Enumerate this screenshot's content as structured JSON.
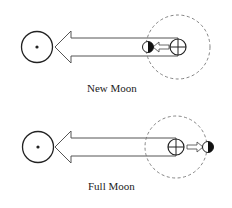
{
  "panels": [
    {
      "id": "new-moon",
      "caption": "New Moon",
      "moon_side": "left"
    },
    {
      "id": "full-moon",
      "caption": "Full Moon",
      "moon_side": "right"
    }
  ],
  "colors": {
    "stroke": "#222222",
    "orbit": "#777777",
    "background": "#ffffff"
  },
  "icons": {
    "sun": "sun-symbol-icon",
    "earth": "earth-symbol-icon",
    "moon": "half-lit-moon-icon"
  }
}
